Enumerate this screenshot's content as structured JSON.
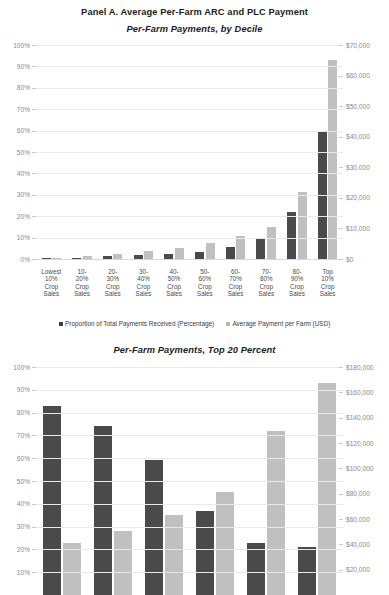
{
  "panel": {
    "title": "Panel A. Average Per-Farm ARC and PLC Payment"
  },
  "legend": {
    "series_dark": "Proportion of Total Payments Received (Percentage)",
    "series_light": "Average Payment per Farm (USD)",
    "dark_color": "#3d3d3d",
    "light_color": "#b4b4b4"
  },
  "chart_data": [
    {
      "type": "bar",
      "title": "Per-Farm Payments, by Decile",
      "xlabel": "",
      "ylabel": "",
      "ylim": [
        0,
        100
      ],
      "y2lim": [
        0,
        70000
      ],
      "grid": true,
      "legend_position": "bottom",
      "categories": [
        "Lowest\n10%\nCrop\nSales",
        "10-\n20%\nCrop\nSales",
        "20-\n30%\nCrop\nSales",
        "30-\n40%\nCrop\nSales",
        "40-\n50%\nCrop\nSales",
        "50-\n60%\nCrop\nSales",
        "60-\n70%\nCrop\nSales",
        "70-\n80%\nCrop\nSales",
        "80-\n90%\nCrop\nSales",
        "Top\n10%\nCrop\nSales"
      ],
      "category_lines": [
        [
          "Lowest",
          "10%",
          "Crop",
          "Sales"
        ],
        [
          "10-",
          "20%",
          "Crop",
          "Sales"
        ],
        [
          "20-",
          "30%",
          "Crop",
          "Sales"
        ],
        [
          "30-",
          "40%",
          "Crop",
          "Sales"
        ],
        [
          "40-",
          "50%",
          "Crop",
          "Sales"
        ],
        [
          "50-",
          "60%",
          "Crop",
          "Sales"
        ],
        [
          "60-",
          "70%",
          "Crop",
          "Sales"
        ],
        [
          "70-",
          "80%",
          "Crop",
          "Sales"
        ],
        [
          "80-",
          "90%",
          "Crop",
          "Sales"
        ],
        [
          "Top",
          "10%",
          "Crop",
          "Sales"
        ]
      ],
      "ytick_labels": [
        "0%",
        "10%",
        "20%",
        "30%",
        "40%",
        "50%",
        "60%",
        "70%",
        "80%",
        "90%",
        "100%"
      ],
      "ytick_values": [
        0,
        10,
        20,
        30,
        40,
        50,
        60,
        70,
        80,
        90,
        100
      ],
      "y2tick_labels": [
        "$0",
        "$10,000",
        "$20,000",
        "$30,000",
        "$40,000",
        "$50,000",
        "$60,000",
        "$70,000"
      ],
      "y2tick_values": [
        0,
        10000,
        20000,
        30000,
        40000,
        50000,
        60000,
        70000
      ],
      "series": [
        {
          "name": "Proportion of Total Payments Received (Percentage)",
          "axis": "left",
          "color": "#4a4a4a",
          "values": [
            0.3,
            0.7,
            1.2,
            1.8,
            2.5,
            3.5,
            5.5,
            9.5,
            22.0,
            60.0
          ]
        },
        {
          "name": "Average Payment per Farm (USD)",
          "axis": "right",
          "color": "#c0c0c0",
          "values": [
            400,
            900,
            1700,
            2600,
            3600,
            5200,
            7500,
            10500,
            22000,
            65000
          ]
        }
      ]
    },
    {
      "type": "bar",
      "title": "Per-Farm Payments, Top 20 Percent",
      "xlabel": "",
      "ylabel": "",
      "ylim": [
        0,
        100
      ],
      "y2lim": [
        0,
        180000
      ],
      "grid": true,
      "legend_position": "none",
      "categories": [
        "1",
        "2",
        "3",
        "4",
        "5",
        "6"
      ],
      "ytick_labels": [
        "10%",
        "20%",
        "30%",
        "40%",
        "50%",
        "60%",
        "70%",
        "80%",
        "90%",
        "100%"
      ],
      "ytick_values": [
        10,
        20,
        30,
        40,
        50,
        60,
        70,
        80,
        90,
        100
      ],
      "y2tick_labels": [
        "$20,000",
        "$40,000",
        "$60,000",
        "$80,000",
        "$100,000",
        "$120,000",
        "$140,000",
        "$160,000",
        "$180,000"
      ],
      "y2tick_values": [
        20000,
        40000,
        60000,
        80000,
        100000,
        120000,
        140000,
        160000,
        180000
      ],
      "series": [
        {
          "name": "Proportion of Total Payments Received (Percentage)",
          "axis": "left",
          "color": "#4a4a4a",
          "values": [
            83,
            74,
            59,
            37,
            23,
            21
          ]
        },
        {
          "name": "Average Payment per Farm (USD)",
          "axis": "right",
          "color": "#c0c0c0",
          "values": [
            23,
            28,
            35,
            45,
            72,
            93
          ]
        }
      ]
    }
  ]
}
